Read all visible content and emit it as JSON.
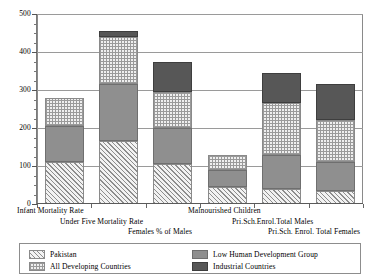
{
  "chart_data": {
    "type": "bar",
    "subtype": "stacked-bar",
    "title": "",
    "xlabel": "",
    "ylabel": "",
    "ylim": [
      0,
      500
    ],
    "yticks": [
      0,
      100,
      200,
      300,
      400,
      500
    ],
    "ytick_labels": [
      "0",
      "100",
      "200",
      "300",
      "400",
      "500"
    ],
    "minor_tick_interval": 25,
    "grid": true,
    "grid_axis": "y",
    "legend_position": "bottom",
    "categories": [
      "Infant Mortality Rate",
      "Under Five Mortality Rate",
      "Females % of Males",
      "Malnourished Children",
      "Pri.Sch.Enrol.Total Males",
      "Pri.Sch. Enrol. Total Females"
    ],
    "series": [
      {
        "name": "Pakistan",
        "pattern": "diagonal-hatch",
        "color": "#8d8d8d",
        "values": [
          110,
          165,
          105,
          45,
          40,
          35
        ]
      },
      {
        "name": "Low Human Development Group",
        "pattern": "solid-gray",
        "color": "#8f8f8f",
        "values": [
          95,
          152,
          95,
          45,
          90,
          75
        ]
      },
      {
        "name": "All Developing Countries",
        "pattern": "checkered",
        "color": "#9a9a9a",
        "values": [
          75,
          122,
          95,
          38,
          135,
          110
        ]
      },
      {
        "name": "Industrial Countries",
        "pattern": "dark-gray",
        "color": "#575757",
        "values": [
          0,
          17,
          80,
          0,
          80,
          95
        ]
      }
    ],
    "bar_totals": [
      280,
      456,
      375,
      128,
      345,
      315
    ]
  },
  "legend": {
    "entries": [
      {
        "label": "Pakistan",
        "pattern": "diagonal-hatch"
      },
      {
        "label": "All Developing Countries",
        "pattern": "checkered"
      },
      {
        "label": "Low Human Development Group",
        "pattern": "solid-gray"
      },
      {
        "label": "Industrial Countries",
        "pattern": "dark-gray"
      }
    ]
  }
}
